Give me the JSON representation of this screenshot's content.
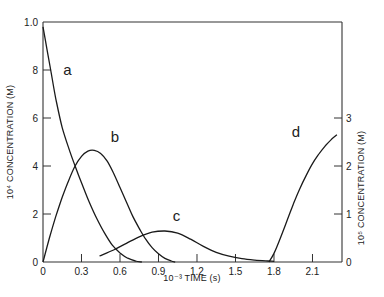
{
  "chart_data": {
    "type": "line",
    "title": "",
    "xlabel": "10⁻³ TIME (s)",
    "ylabel_left": "10⁴ CONCENTRATION (M)",
    "ylabel_right": "10⁵ CONCENTRATION (M)",
    "xlim": [
      0,
      2.33
    ],
    "ylim_left": [
      0,
      1.0
    ],
    "ylim_right": [
      0,
      5
    ],
    "grid": false,
    "legend": "none (curves labeled inline)",
    "x_ticks": [
      {
        "value": 0,
        "label": "0"
      },
      {
        "value": 0.3,
        "label": "0.3"
      },
      {
        "value": 0.6,
        "label": "0.6"
      },
      {
        "value": 0.9,
        "label": "0.9"
      },
      {
        "value": 1.2,
        "label": "1.2"
      },
      {
        "value": 1.5,
        "label": "1.5"
      },
      {
        "value": 1.8,
        "label": "1.8"
      },
      {
        "value": 2.1,
        "label": "2.1"
      }
    ],
    "y_ticks_left": [
      {
        "value": 0.2,
        "label": "2"
      },
      {
        "value": 0.4,
        "label": "4"
      },
      {
        "value": 0.6,
        "label": "6"
      },
      {
        "value": 0.8,
        "label": "8"
      },
      {
        "value": 1.0,
        "label": "1.0"
      }
    ],
    "y_ticks_right": [
      {
        "value": 0,
        "label": "0"
      },
      {
        "value": 1,
        "label": "1"
      },
      {
        "value": 2,
        "label": "2"
      },
      {
        "value": 3,
        "label": "3"
      }
    ],
    "series": [
      {
        "name": "a",
        "axis": "left",
        "label_at": [
          0.19,
          0.78
        ],
        "x": [
          0,
          0.03,
          0.06,
          0.1,
          0.15,
          0.21,
          0.25,
          0.3,
          0.36,
          0.42,
          0.48,
          0.54,
          0.6,
          0.66,
          0.72,
          0.77
        ],
        "y": [
          0.98,
          0.89,
          0.8,
          0.68,
          0.56,
          0.46,
          0.4,
          0.33,
          0.25,
          0.18,
          0.12,
          0.07,
          0.038,
          0.016,
          0.004,
          0
        ]
      },
      {
        "name": "b",
        "axis": "left",
        "label_at": [
          0.56,
          0.5
        ],
        "x": [
          0,
          0.05,
          0.1,
          0.15,
          0.2,
          0.25,
          0.3,
          0.35,
          0.4,
          0.45,
          0.5,
          0.55,
          0.6,
          0.65,
          0.7,
          0.75,
          0.8,
          0.85,
          0.9,
          0.95,
          1.0,
          1.03
        ],
        "y": [
          0,
          0.1,
          0.19,
          0.27,
          0.34,
          0.4,
          0.44,
          0.462,
          0.465,
          0.452,
          0.42,
          0.37,
          0.31,
          0.25,
          0.19,
          0.14,
          0.095,
          0.06,
          0.034,
          0.015,
          0.004,
          0
        ]
      },
      {
        "name": "c",
        "axis": "left",
        "label_at": [
          1.04,
          0.17
        ],
        "x": [
          0.44,
          0.55,
          0.65,
          0.75,
          0.85,
          0.95,
          1.05,
          1.15,
          1.25,
          1.35,
          1.45,
          1.55,
          1.65,
          1.75,
          1.8
        ],
        "y": [
          0.025,
          0.05,
          0.078,
          0.105,
          0.124,
          0.129,
          0.12,
          0.095,
          0.065,
          0.04,
          0.024,
          0.014,
          0.008,
          0.004,
          0.003
        ]
      },
      {
        "name": "d",
        "axis": "right",
        "label_at": [
          1.97,
          2.6
        ],
        "x": [
          1.76,
          1.8,
          1.85,
          1.9,
          1.95,
          2.0,
          2.05,
          2.1,
          2.15,
          2.2,
          2.25,
          2.29
        ],
        "y": [
          0,
          0.18,
          0.5,
          0.85,
          1.2,
          1.52,
          1.8,
          2.05,
          2.25,
          2.42,
          2.56,
          2.65
        ]
      }
    ]
  }
}
